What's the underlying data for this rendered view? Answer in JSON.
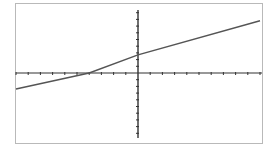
{
  "caption": {
    "text": ""
  },
  "chart_data": {
    "type": "line",
    "title": "",
    "xlabel": "",
    "ylabel": "",
    "xlim": [
      -10,
      10
    ],
    "ylim": [
      -10,
      10
    ],
    "grid": false,
    "legend": null,
    "x_ticks": [
      -10,
      -9,
      -8,
      -7,
      -6,
      -5,
      -4,
      -3,
      -2,
      -1,
      0,
      1,
      2,
      3,
      4,
      5,
      6,
      7,
      8,
      9,
      10
    ],
    "y_ticks": [
      -10,
      -9,
      -8,
      -7,
      -6,
      -5,
      -4,
      -3,
      -2,
      -1,
      0,
      1,
      2,
      3,
      4,
      5,
      6,
      7,
      8,
      9,
      10
    ],
    "tick_labels_shown": false,
    "series": [
      {
        "name": "line",
        "color": "#555555",
        "x": [
          -10,
          -4,
          0,
          10
        ],
        "y": [
          -2.4,
          0,
          2.7,
          7.8
        ],
        "slope": 0.66,
        "y_intercept": 2.7,
        "x_intercept": -4
      }
    ]
  },
  "colors": {
    "axis": "#333333",
    "line": "#555555",
    "frame": "#b9b9b9"
  }
}
